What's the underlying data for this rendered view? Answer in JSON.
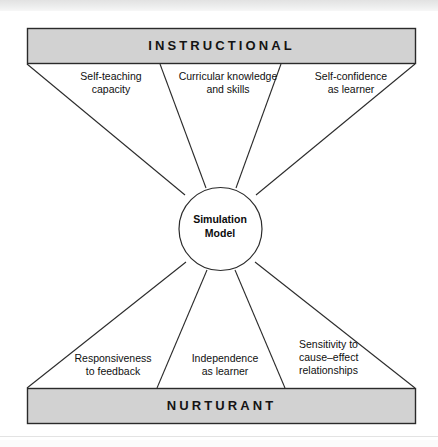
{
  "diagram": {
    "center": {
      "label": "Simulation\nModel"
    },
    "bands": {
      "top": {
        "label": "INSTRUCTIONAL"
      },
      "bottom": {
        "label": "NURTURANT"
      }
    },
    "instructional_effects": [
      {
        "id": "self-teaching-capacity",
        "label": "Self-teaching\ncapacity"
      },
      {
        "id": "curricular-knowledge-and-skills",
        "label": "Curricular knowledge\nand skills"
      },
      {
        "id": "self-confidence-as-learner",
        "label": "Self-confidence\nas learner"
      }
    ],
    "nurturant_effects": [
      {
        "id": "responsiveness-to-feedback",
        "label": "Responsiveness\nto feedback"
      },
      {
        "id": "independence-as-learner",
        "label": "Independence\nas learner"
      },
      {
        "id": "sensitivity-to-cause-effect-relationships",
        "label": "Sensitivity to\ncause–effect\nrelationships"
      }
    ],
    "style": {
      "band_fill": "#d2d2d2",
      "band_stroke": "#2a2a2a",
      "line_stroke": "#2b2b2b",
      "circle_fill": "#ffffff",
      "page_background": "#ffffff"
    }
  }
}
